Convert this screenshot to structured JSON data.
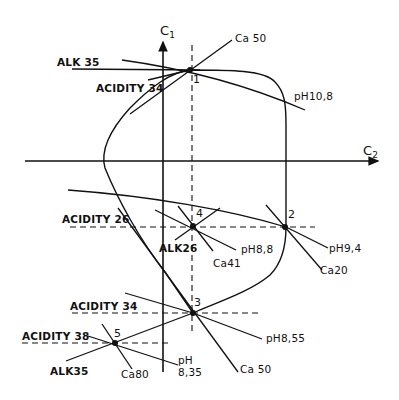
{
  "axes": {
    "c1": {
      "label": "C",
      "subscript": "1"
    },
    "c2": {
      "label": "C",
      "subscript": "2"
    }
  },
  "points": [
    {
      "id": "1",
      "label": "1"
    },
    {
      "id": "2",
      "label": "2"
    },
    {
      "id": "3",
      "label": "3"
    },
    {
      "id": "4",
      "label": "4"
    },
    {
      "id": "5",
      "label": "5"
    }
  ],
  "labels": {
    "alk35_top": "ALK 35",
    "acidity34_top": "ACIDITY 34",
    "ca50_top": "Ca 50",
    "ph108": "pH10,8",
    "acidity26": "ACIDITY 26",
    "alk26": "ALK26",
    "ph88": "pH8,8",
    "ca41": "Ca41",
    "ph94": "pH9,4",
    "ca20": "Ca20",
    "acidity34_mid": "ACIDITY 34",
    "ph855": "pH8,55",
    "ca50_bottom": "Ca 50",
    "acidity38": "ACIDITY 38",
    "alk35_bottom": "ALK35",
    "ca80": "Ca80",
    "ph835_line1": "pH",
    "ph835_line2": "8,35"
  },
  "colors": {
    "ink": "#111111",
    "background": "#ffffff"
  }
}
